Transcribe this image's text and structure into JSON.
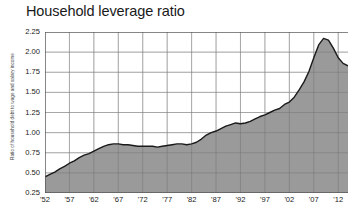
{
  "chart_data": {
    "type": "area",
    "title": "Household leverage ratio",
    "xlabel": "",
    "ylabel": "Ratio of household debt to wage and salary income",
    "xlim": [
      1952,
      2014
    ],
    "ylim": [
      0.25,
      2.25
    ],
    "ytick_values": [
      0.25,
      0.5,
      0.75,
      1.0,
      1.25,
      1.5,
      1.75,
      2.0,
      2.25
    ],
    "ytick_labels": [
      "0.25",
      "0.50",
      "0.75",
      "1.00",
      "1.25",
      "1.50",
      "1.75",
      "2.00",
      "2.25"
    ],
    "xtick_values": [
      1952,
      1957,
      1962,
      1967,
      1972,
      1977,
      1982,
      1987,
      1992,
      1997,
      2002,
      2007,
      2012
    ],
    "xtick_labels": [
      "'52",
      "'57",
      "'62",
      "'67",
      "'72",
      "'77",
      "'82",
      "'87",
      "'92",
      "'97",
      "'02",
      "'07",
      "'12"
    ],
    "grid": true,
    "legend": "none",
    "colors": {
      "area_fill": "#9a9a9a",
      "line": "#1a1a1a",
      "grid": "#6f6f6f",
      "text": "#222222",
      "background": "#ffffff"
    },
    "x": [
      1952,
      1953,
      1954,
      1955,
      1956,
      1957,
      1958,
      1959,
      1960,
      1961,
      1962,
      1963,
      1964,
      1965,
      1966,
      1967,
      1968,
      1969,
      1970,
      1971,
      1972,
      1973,
      1974,
      1975,
      1976,
      1977,
      1978,
      1979,
      1980,
      1981,
      1982,
      1983,
      1984,
      1985,
      1986,
      1987,
      1988,
      1989,
      1990,
      1991,
      1992,
      1993,
      1994,
      1995,
      1996,
      1997,
      1998,
      1999,
      2000,
      2001,
      2002,
      2003,
      2004,
      2005,
      2006,
      2007,
      2008,
      2009,
      2010,
      2011,
      2012,
      2013,
      2014
    ],
    "values": [
      0.45,
      0.48,
      0.51,
      0.55,
      0.58,
      0.62,
      0.65,
      0.69,
      0.72,
      0.74,
      0.77,
      0.8,
      0.83,
      0.85,
      0.86,
      0.86,
      0.85,
      0.85,
      0.84,
      0.83,
      0.83,
      0.83,
      0.83,
      0.82,
      0.83,
      0.84,
      0.85,
      0.86,
      0.86,
      0.85,
      0.86,
      0.88,
      0.92,
      0.97,
      1.0,
      1.02,
      1.05,
      1.08,
      1.1,
      1.12,
      1.11,
      1.12,
      1.14,
      1.17,
      1.2,
      1.22,
      1.25,
      1.28,
      1.3,
      1.35,
      1.38,
      1.44,
      1.53,
      1.63,
      1.76,
      1.93,
      2.09,
      2.17,
      2.15,
      2.05,
      1.93,
      1.86,
      1.83
    ]
  }
}
